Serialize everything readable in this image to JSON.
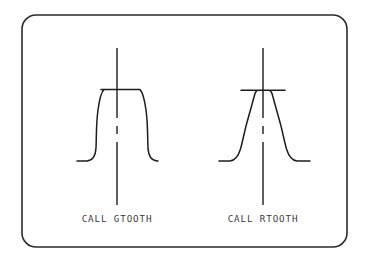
{
  "page": {
    "background_color": "#ffffff",
    "ink_color": "#1d1d1d",
    "frame_color": "#2b2b2b"
  },
  "frame": {
    "name": "rounded-border-frame",
    "x": 22,
    "y": 15,
    "width": 325,
    "height": 232,
    "corner_radius": 14
  },
  "figures": [
    {
      "id": "gtooth",
      "caption": "CALL GTOOTH",
      "profile_type": "curved-flank-tooth",
      "center_x": 117,
      "plateau_y": 89,
      "plateau_left_x": 101,
      "plateau_right_x": 140,
      "baseline_y": 161,
      "baseline_left_x": 77,
      "baseline_right_x": 158,
      "caption_x": 117,
      "caption_y": 222,
      "centerline_top_y": 48,
      "centerline_bottom_y": 205
    },
    {
      "id": "rtooth",
      "caption": "CALL RTOOTH",
      "profile_type": "straight-flank-tooth",
      "center_x": 263,
      "plateau_y": 90,
      "plateau_left_x": 241,
      "plateau_right_x": 285,
      "baseline_y": 161,
      "baseline_left_x": 219,
      "baseline_right_x": 310,
      "caption_x": 263,
      "caption_y": 222,
      "centerline_top_y": 48,
      "centerline_bottom_y": 205
    }
  ],
  "paths": {
    "gtooth_profile": "M 77,161 L 87,161 C 93,160.5 95.5,156 96,148 C 96.5,139 96,124 98,110 C 99.5,99 101,92 104,89.6 L 101,89.6 L 140,89.6 C 143,92.4 144.5,99.5 146,110 C 148,124 147.5,139 148,148 C 148.5,156 151,160.5 157,161 L 158,161",
    "rtooth_profile": "M 219,161 L 230,161 C 235,160.6 238,157 240.5,149 C 242.5,142 244,134 246,126 L 255,93.5 C 255.8,91.2 256.8,90.2 258,90.2 L 241,90.2 L 285,90.2 L 269,90.2 C 270.2,90.2 271.2,91.2 272,93.5 L 281,126 C 283,134 284.5,142 286.5,149 C 289,157 292,160.6 297,161 L 310,161",
    "gtooth_centerline": "M 117,48 L 117,118 M 117,126 L 117,134 M 117,142 L 117,205",
    "rtooth_centerline": "M 263,48 L 263,118 M 263,126 L 263,134 M 263,142 L 263,205"
  }
}
